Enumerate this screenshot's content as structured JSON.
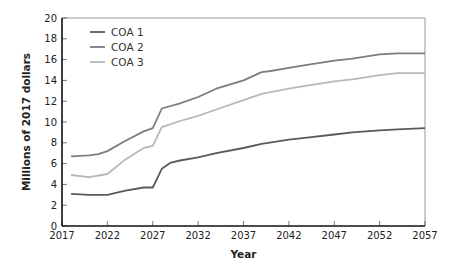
{
  "chart_data": {
    "type": "line",
    "title": "",
    "xlabel": "Year",
    "ylabel": "Millions of 2017 dollars",
    "xlim": [
      2017,
      2057
    ],
    "ylim": [
      0,
      20
    ],
    "x_ticks": [
      2017,
      2022,
      2027,
      2032,
      2037,
      2042,
      2047,
      2052,
      2057
    ],
    "y_ticks": [
      0,
      2,
      4,
      6,
      8,
      10,
      12,
      14,
      16,
      18,
      20
    ],
    "grid": false,
    "legend_position": "upper-left",
    "series": [
      {
        "name": "COA 1",
        "color": "#5a5a5a",
        "x": [
          2018,
          2020,
          2022,
          2024,
          2026,
          2027,
          2028,
          2029,
          2030,
          2032,
          2034,
          2037,
          2039,
          2042,
          2044,
          2047,
          2049,
          2052,
          2054,
          2057
        ],
        "values": [
          3.1,
          3.0,
          3.0,
          3.4,
          3.7,
          3.7,
          5.5,
          6.1,
          6.3,
          6.6,
          7.0,
          7.5,
          7.9,
          8.3,
          8.5,
          8.8,
          9.0,
          9.2,
          9.3,
          9.4
        ]
      },
      {
        "name": "COA 2",
        "color": "#7d7d7d",
        "x": [
          2018,
          2020,
          2021,
          2022,
          2024,
          2026,
          2027,
          2028,
          2030,
          2032,
          2034,
          2037,
          2039,
          2040,
          2042,
          2044,
          2047,
          2049,
          2052,
          2054,
          2057
        ],
        "values": [
          6.7,
          6.8,
          6.9,
          7.2,
          8.2,
          9.1,
          9.4,
          11.3,
          11.8,
          12.4,
          13.2,
          14.0,
          14.8,
          14.9,
          15.2,
          15.5,
          15.9,
          16.1,
          16.5,
          16.6,
          16.6
        ]
      },
      {
        "name": "COA 3",
        "color": "#b8b8b8",
        "x": [
          2018,
          2020,
          2022,
          2024,
          2026,
          2027,
          2028,
          2030,
          2032,
          2034,
          2037,
          2039,
          2042,
          2044,
          2047,
          2049,
          2052,
          2054,
          2057
        ],
        "values": [
          4.9,
          4.7,
          5.0,
          6.4,
          7.5,
          7.7,
          9.5,
          10.1,
          10.6,
          11.2,
          12.1,
          12.7,
          13.2,
          13.5,
          13.9,
          14.1,
          14.5,
          14.7,
          14.7
        ]
      }
    ]
  },
  "legend": {
    "items": [
      {
        "label": "COA 1",
        "color": "#5a5a5a"
      },
      {
        "label": "COA 2",
        "color": "#7d7d7d"
      },
      {
        "label": "COA 3",
        "color": "#b8b8b8"
      }
    ]
  },
  "axes": {
    "x_title": "Year",
    "y_title": "Millions of 2017 dollars"
  }
}
